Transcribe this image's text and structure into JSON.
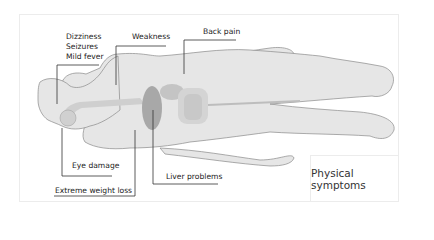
{
  "diagram": {
    "title": "Physical symptoms",
    "labels": [
      {
        "id": "head",
        "lines": [
          "Dizziness",
          "Seizures",
          "Mild fever"
        ]
      },
      {
        "id": "weakness",
        "text": "Weakness"
      },
      {
        "id": "back",
        "text": "Back pain"
      },
      {
        "id": "eye",
        "text": "Eye damage"
      },
      {
        "id": "weight",
        "text": "Extreme weight loss"
      },
      {
        "id": "liver",
        "text": "Liver problems"
      }
    ],
    "colors": {
      "body_fill": "#e6e6e6",
      "body_stroke": "#8a8a8a",
      "organ_dark": "#a8a8a8",
      "organ_mid": "#c4c4c4",
      "organ_light": "#d4d4d4",
      "leader_line": "#333333"
    }
  }
}
